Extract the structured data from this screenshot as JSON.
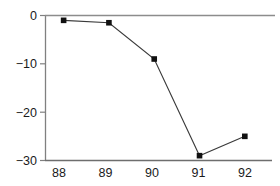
{
  "chart_data": {
    "type": "line",
    "title": "",
    "subtitle": "",
    "xlabel": "",
    "ylabel": "",
    "categories": [
      "88",
      "89",
      "90",
      "91",
      "92"
    ],
    "x": [
      88,
      89,
      90,
      91,
      92
    ],
    "values": [
      -1,
      -1.5,
      -9,
      -29,
      -25
    ],
    "series": [
      {
        "name": "series-1",
        "values": [
          -1,
          -1.5,
          -9,
          -29,
          -25
        ],
        "marker": "square",
        "marker_color": "#111111",
        "line_color": "#3a3a3a"
      }
    ],
    "xlim": [
      87.6,
      92.6
    ],
    "ylim": [
      -31.5,
      0.6
    ],
    "ytick_labels": [
      "0",
      "−10",
      "−20",
      "−30"
    ],
    "ytick_values": [
      0,
      -10,
      -20,
      -30
    ],
    "xtick_labels": [
      "88",
      "89",
      "90",
      "91",
      "92"
    ],
    "xtick_values": [
      88,
      89,
      90,
      91,
      92
    ],
    "grid": false,
    "legend": null,
    "legend_position": "none",
    "annotations": [],
    "spines": {
      "left": true,
      "bottom": true,
      "top": true,
      "right": false
    },
    "colors": {
      "background": "#ffffff",
      "axis": "#808080",
      "zero_line": "#8c8c8c",
      "text": "#1a1a1a",
      "marker": "#111111",
      "line": "#3a3a3a"
    }
  }
}
